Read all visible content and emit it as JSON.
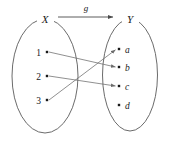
{
  "diagram": {
    "function_label": "g",
    "domain_set": {
      "name": "X",
      "label": "X",
      "elements": [
        {
          "label": "1",
          "dot_x": 47,
          "dot_y": 52,
          "label_x": 38,
          "label_y": 55
        },
        {
          "label": "2",
          "dot_x": 47,
          "dot_y": 76,
          "label_x": 38,
          "label_y": 79
        },
        {
          "label": "3",
          "dot_x": 47,
          "dot_y": 100,
          "label_x": 38,
          "label_y": 103
        }
      ],
      "ellipse": {
        "cx": 45,
        "cy": 76,
        "rx": 33,
        "ry": 57
      },
      "label_pos": {
        "x": 45,
        "y": 23
      }
    },
    "codomain_set": {
      "name": "Y",
      "label": "Y",
      "elements": [
        {
          "label": "a",
          "dot_x": 119,
          "dot_y": 49,
          "label_x": 125,
          "label_y": 53
        },
        {
          "label": "b",
          "dot_x": 119,
          "dot_y": 67,
          "label_x": 125,
          "label_y": 71
        },
        {
          "label": "c",
          "dot_x": 119,
          "dot_y": 86,
          "label_x": 125,
          "label_y": 90
        },
        {
          "label": "d",
          "dot_x": 119,
          "dot_y": 105,
          "label_x": 125,
          "label_y": 109
        }
      ],
      "ellipse": {
        "cx": 130,
        "cy": 75,
        "rx": 27.5,
        "ry": 56
      },
      "label_pos": {
        "x": 130,
        "y": 23
      }
    },
    "mappings": [
      {
        "from": "1",
        "to": "b",
        "x1": 49,
        "y1": 52,
        "x2": 117,
        "y2": 67
      },
      {
        "from": "2",
        "to": "c",
        "x1": 49,
        "y1": 76,
        "x2": 117,
        "y2": 86
      },
      {
        "from": "3",
        "to": "a",
        "x1": 49,
        "y1": 100,
        "x2": 117,
        "y2": 49
      }
    ],
    "unmapped_elements": [
      "d"
    ],
    "function_arrow": {
      "label": "g",
      "x1": 58,
      "y1": 17,
      "x2": 115,
      "y2": 17,
      "label_x": 86,
      "label_y": 11
    },
    "colors": {
      "outline": "#5a5a5a",
      "line": "#6b6b6b",
      "dot": "#1a1a1a",
      "text": "#1a1a1a",
      "background": "#ffffff"
    }
  }
}
